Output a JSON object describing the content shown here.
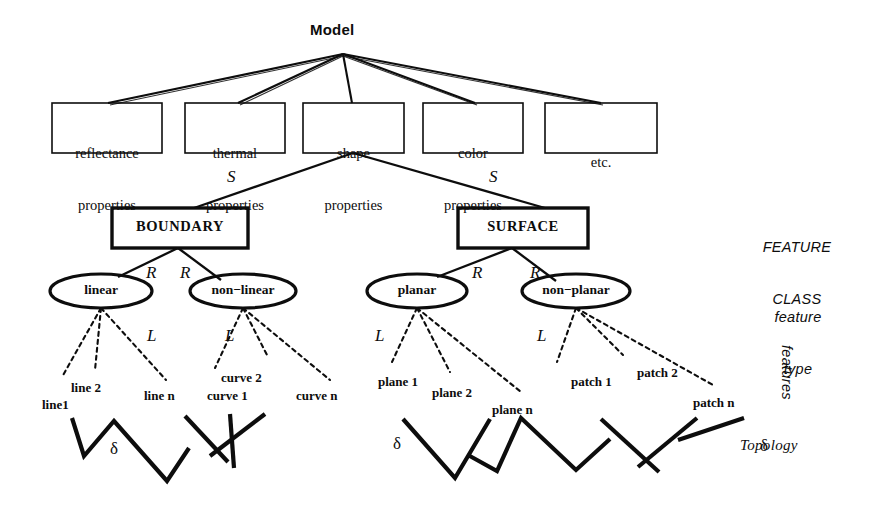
{
  "figure": {
    "root": {
      "label": "Model",
      "x": 310,
      "y": 22
    },
    "property_boxes": [
      {
        "id": "reflectance",
        "line1": "reflectance",
        "line2": "properties",
        "x": 52,
        "y": 103,
        "w": 110,
        "h": 50
      },
      {
        "id": "thermal",
        "line1": "thermal",
        "line2": "properties",
        "x": 185,
        "y": 103,
        "w": 100,
        "h": 50
      },
      {
        "id": "shape",
        "line1": "shape",
        "line2": "properties",
        "x": 303,
        "y": 103,
        "w": 101,
        "h": 50
      },
      {
        "id": "color",
        "line1": "color",
        "line2": "properties",
        "x": 423,
        "y": 103,
        "w": 100,
        "h": 50
      },
      {
        "id": "etc",
        "line1": "etc.",
        "line2": "",
        "x": 545,
        "y": 103,
        "w": 112,
        "h": 50
      }
    ],
    "feature_classes": [
      {
        "id": "boundary",
        "label": "BOUNDARY",
        "x": 112,
        "y": 208,
        "w": 136,
        "h": 40
      },
      {
        "id": "surface",
        "label": "SURFACE",
        "x": 458,
        "y": 208,
        "w": 130,
        "h": 40
      }
    ],
    "feature_types": [
      {
        "id": "linear",
        "label": "linear",
        "cx": 101,
        "cy": 291,
        "rx": 51,
        "ry": 17
      },
      {
        "id": "non-linear",
        "label": "non−linear",
        "cx": 243,
        "cy": 291,
        "rx": 53,
        "ry": 17
      },
      {
        "id": "planar",
        "label": "planar",
        "cx": 417,
        "cy": 291,
        "rx": 50,
        "ry": 17
      },
      {
        "id": "non-planar",
        "label": "non−planar",
        "cx": 576,
        "cy": 291,
        "rx": 54,
        "ry": 17
      }
    ],
    "edge_letters": [
      {
        "id": "s-left",
        "label": "S",
        "x": 227,
        "y": 168
      },
      {
        "id": "s-right",
        "label": "S",
        "x": 489,
        "y": 168
      },
      {
        "id": "r-linear",
        "label": "R",
        "x": 146,
        "y": 264
      },
      {
        "id": "r-nonlinear",
        "label": "R",
        "x": 180,
        "y": 264
      },
      {
        "id": "r-planar",
        "label": "R",
        "x": 472,
        "y": 264
      },
      {
        "id": "r-nonplanar",
        "label": "R",
        "x": 530,
        "y": 264
      },
      {
        "id": "l-linear",
        "label": "L",
        "x": 147,
        "y": 327
      },
      {
        "id": "l-nonlinear",
        "label": "L",
        "x": 225,
        "y": 327
      },
      {
        "id": "l-planar",
        "label": "L",
        "x": 375,
        "y": 327
      },
      {
        "id": "l-nonplanar",
        "label": "L",
        "x": 537,
        "y": 327
      }
    ],
    "features": [
      {
        "id": "line1",
        "label": "line1",
        "x": 42,
        "y": 398
      },
      {
        "id": "line2",
        "label": "line 2",
        "x": 71,
        "y": 381
      },
      {
        "id": "line-n",
        "label": "line n",
        "x": 144,
        "y": 389
      },
      {
        "id": "curve1",
        "label": "curve 1",
        "x": 207,
        "y": 389
      },
      {
        "id": "curve2",
        "label": "curve 2",
        "x": 221,
        "y": 371
      },
      {
        "id": "curve-n",
        "label": "curve n",
        "x": 296,
        "y": 389
      },
      {
        "id": "plane1",
        "label": "plane 1",
        "x": 378,
        "y": 375
      },
      {
        "id": "plane2",
        "label": "plane 2",
        "x": 432,
        "y": 386
      },
      {
        "id": "plane-n",
        "label": "plane n",
        "x": 492,
        "y": 403
      },
      {
        "id": "patch1",
        "label": "patch 1",
        "x": 571,
        "y": 375
      },
      {
        "id": "patch2",
        "label": "patch 2",
        "x": 637,
        "y": 366
      },
      {
        "id": "patch-n",
        "label": "patch n",
        "x": 693,
        "y": 396
      }
    ],
    "deltas": [
      {
        "id": "delta-1",
        "label": "δ",
        "x": 110,
        "y": 440
      },
      {
        "id": "delta-2",
        "label": "δ",
        "x": 393,
        "y": 435
      },
      {
        "id": "delta-3",
        "label": "δ",
        "x": 760,
        "y": 437
      }
    ],
    "level_annotations": [
      {
        "id": "feature-class",
        "line1": "FEATURE",
        "line2": "CLASS",
        "x": 742,
        "y": 204,
        "style": "sans-italic"
      },
      {
        "id": "feature-type",
        "line1": "feature",
        "line2": "type",
        "x": 748,
        "y": 274,
        "style": "sans-italic"
      },
      {
        "id": "features",
        "line1": "features",
        "line2": "",
        "x": 776,
        "y": 345,
        "style": "sans-italic-rotated"
      },
      {
        "id": "topology",
        "line1": "Topology",
        "line2": "",
        "x": 740,
        "y": 437,
        "style": "serif-italic"
      }
    ],
    "colors": {
      "ink": "#0d0d0d",
      "background": "#ffffff"
    }
  }
}
